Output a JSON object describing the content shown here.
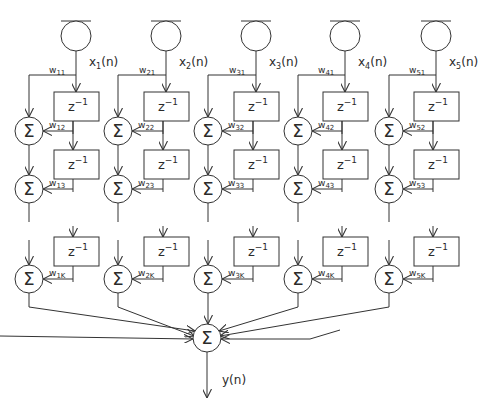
{
  "diagram": {
    "inputs": [
      {
        "label": "x",
        "sub": "1",
        "suffix": "(n)",
        "weights": [
          "w11",
          "w12",
          "w13",
          "w1K"
        ],
        "wmain": [
          "w",
          "w",
          "w",
          "w"
        ],
        "wsub": [
          "11",
          "12",
          "13",
          "1K"
        ]
      },
      {
        "label": "x",
        "sub": "2",
        "suffix": "(n)",
        "wmain": [
          "w",
          "w",
          "w",
          "w"
        ],
        "wsub": [
          "21",
          "22",
          "23",
          "2K"
        ]
      },
      {
        "label": "x",
        "sub": "3",
        "suffix": "(n)",
        "wmain": [
          "w",
          "w",
          "w",
          "w"
        ],
        "wsub": [
          "31",
          "32",
          "33",
          "3K"
        ]
      },
      {
        "label": "x",
        "sub": "4",
        "suffix": "(n)",
        "wmain": [
          "w",
          "w",
          "w",
          "w"
        ],
        "wsub": [
          "41",
          "42",
          "43",
          "4K"
        ]
      },
      {
        "label": "x",
        "sub": "5",
        "suffix": "(n)",
        "wmain": [
          "w",
          "w",
          "w",
          "w"
        ],
        "wsub": [
          "51",
          "52",
          "53",
          "5K"
        ]
      }
    ],
    "delay_label": "z",
    "delay_exp": "−1",
    "sum_symbol": "Σ",
    "output_label": "y(n)"
  }
}
